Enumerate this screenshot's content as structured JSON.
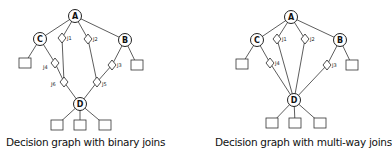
{
  "figures": [
    {
      "caption": "Decision graph with binary joins",
      "nodes": [
        {
          "id": "A",
          "label": "A",
          "x": 75,
          "y": 16
        },
        {
          "id": "C",
          "label": "C",
          "x": 40,
          "y": 39
        },
        {
          "id": "B",
          "label": "B",
          "x": 125,
          "y": 40
        },
        {
          "id": "D",
          "label": "D",
          "x": 80,
          "y": 104
        }
      ],
      "joins": [
        {
          "id": "J1",
          "label": "J1",
          "x": 62,
          "y": 38
        },
        {
          "id": "J2",
          "label": "J2",
          "x": 88,
          "y": 39
        },
        {
          "id": "J3",
          "label": "J3",
          "x": 112,
          "y": 65
        },
        {
          "id": "J4",
          "label": "J4",
          "x": 55,
          "y": 63
        },
        {
          "id": "J5",
          "label": "J5",
          "x": 97,
          "y": 82
        },
        {
          "id": "J6",
          "label": "J6",
          "x": 64,
          "y": 82
        }
      ],
      "leaves": [
        {
          "x": 25,
          "y": 63
        },
        {
          "x": 137,
          "y": 65
        },
        {
          "x": 57,
          "y": 125
        },
        {
          "x": 80,
          "y": 125
        },
        {
          "x": 105,
          "y": 125
        }
      ]
    },
    {
      "caption": "Decision graph with multi-way joins",
      "nodes": [
        {
          "id": "A",
          "label": "A",
          "x": 291,
          "y": 17
        },
        {
          "id": "C",
          "label": "C",
          "x": 257,
          "y": 40
        },
        {
          "id": "B",
          "label": "B",
          "x": 340,
          "y": 40
        },
        {
          "id": "D",
          "label": "D",
          "x": 294,
          "y": 100
        }
      ],
      "joins": [
        {
          "id": "J1",
          "label": "J1",
          "x": 277,
          "y": 39
        },
        {
          "id": "J2",
          "label": "J2",
          "x": 305,
          "y": 39
        },
        {
          "id": "J3",
          "label": "J3",
          "x": 327,
          "y": 65
        },
        {
          "id": "J4",
          "label": "J4",
          "x": 270,
          "y": 63
        }
      ],
      "leaves": [
        {
          "x": 242,
          "y": 64
        },
        {
          "x": 352,
          "y": 65
        },
        {
          "x": 272,
          "y": 123
        },
        {
          "x": 295,
          "y": 123
        },
        {
          "x": 320,
          "y": 123
        }
      ]
    }
  ]
}
